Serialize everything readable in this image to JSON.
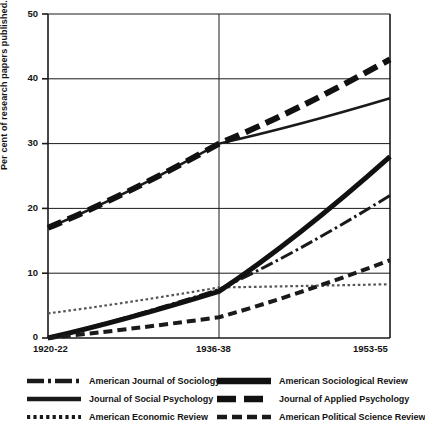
{
  "chart_data": {
    "type": "line",
    "title": "",
    "xlabel": "",
    "ylabel": "Per cent of research papers published.",
    "x": [
      "1920-22",
      "1936-38",
      "1953-55"
    ],
    "categories": [
      "1920-22",
      "1936-38",
      "1953-55"
    ],
    "ylim": [
      0,
      50
    ],
    "yticks": [
      0,
      10,
      20,
      30,
      40,
      50
    ],
    "ytick_labels": [
      "0",
      "10",
      "20",
      "30",
      "40",
      "50"
    ],
    "grid": true,
    "legend_position": "below",
    "series": [
      {
        "name": "American Journal of Sociology",
        "style": "dash-dot",
        "color": "#1a1a1a",
        "values": [
          0,
          7.5,
          22
        ]
      },
      {
        "name": "Journal of Social Psychology",
        "style": "solid-thin",
        "color": "#1a1a1a",
        "values": [
          17,
          30,
          37
        ]
      },
      {
        "name": "American Economic Review",
        "style": "dotted",
        "color": "#555555",
        "values": [
          3.8,
          7.8,
          8.3
        ]
      },
      {
        "name": "American Sociological Review",
        "style": "solid-thick",
        "color": "#111111",
        "values": [
          0,
          7.2,
          28
        ]
      },
      {
        "name": "Journal of Applied Psychology",
        "style": "dash-thick",
        "color": "#111111",
        "values": [
          17,
          30,
          43
        ]
      },
      {
        "name": "American Political Science Review",
        "style": "dash-medium",
        "color": "#1a1a1a",
        "values": [
          0,
          3.2,
          12
        ]
      }
    ]
  },
  "axes": {
    "ylabel": "Per cent of research papers published.",
    "ytick_50": "50",
    "ytick_40": "40",
    "ytick_30": "30",
    "ytick_20": "20",
    "ytick_10": "10",
    "ytick_0": "0",
    "xtick_1": "1920-22",
    "xtick_2": "1936-38",
    "xtick_3": "1953-55"
  },
  "legend": {
    "items": [
      {
        "label": "American Journal of Sociology"
      },
      {
        "label": "Journal of Social Psychology"
      },
      {
        "label": "American Economic Review"
      },
      {
        "label": "American Sociological Review"
      },
      {
        "label": "Journal of Applied Psychology"
      },
      {
        "label": "American Political Science Review"
      }
    ]
  }
}
